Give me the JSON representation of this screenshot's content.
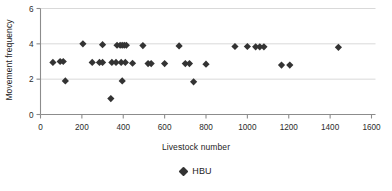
{
  "chart_data": {
    "type": "scatter",
    "title": "",
    "xlabel": "Livestock number",
    "ylabel": "Movement frequency",
    "xlim": [
      0,
      1600
    ],
    "ylim": [
      0,
      6
    ],
    "xticks": [
      0,
      200,
      400,
      600,
      800,
      1000,
      1200,
      1400,
      1600
    ],
    "yticks": [
      0,
      2,
      4,
      6
    ],
    "xtick_labels": [
      "0",
      "200",
      "400",
      "600",
      "800",
      "1000",
      "1200",
      "1400",
      "1600"
    ],
    "ytick_labels": [
      "0",
      "2",
      "4",
      "6"
    ],
    "grid": "horizontal",
    "grid_color": "#d9d9d9",
    "axis_color": "#8c8c8c",
    "marker": "diamond",
    "marker_color": "#333333",
    "marker_size": 6,
    "legend_position": "bottom",
    "series": [
      {
        "name": "HBU",
        "points": [
          [
            60,
            2.95
          ],
          [
            95,
            3.0
          ],
          [
            110,
            3.0
          ],
          [
            120,
            1.9
          ],
          [
            205,
            4.0
          ],
          [
            250,
            2.95
          ],
          [
            285,
            2.95
          ],
          [
            300,
            2.95
          ],
          [
            300,
            3.95
          ],
          [
            340,
            0.9
          ],
          [
            345,
            2.95
          ],
          [
            365,
            2.95
          ],
          [
            370,
            3.92
          ],
          [
            385,
            3.92
          ],
          [
            390,
            2.95
          ],
          [
            395,
            1.9
          ],
          [
            395,
            3.92
          ],
          [
            405,
            3.92
          ],
          [
            410,
            2.95
          ],
          [
            415,
            3.92
          ],
          [
            445,
            2.9
          ],
          [
            495,
            3.9
          ],
          [
            520,
            2.88
          ],
          [
            535,
            2.88
          ],
          [
            600,
            2.88
          ],
          [
            670,
            3.88
          ],
          [
            700,
            2.88
          ],
          [
            720,
            2.88
          ],
          [
            740,
            1.85
          ],
          [
            800,
            2.85
          ],
          [
            940,
            3.85
          ],
          [
            1000,
            3.85
          ],
          [
            1040,
            3.83
          ],
          [
            1060,
            3.83
          ],
          [
            1080,
            3.83
          ],
          [
            1165,
            2.8
          ],
          [
            1205,
            2.8
          ],
          [
            1440,
            3.8
          ]
        ]
      }
    ]
  },
  "legend": {
    "entries": [
      {
        "label": "HBU",
        "marker": "diamond",
        "color": "#333333"
      }
    ]
  },
  "axes": {
    "x_label": "Livestock number",
    "y_label": "Movement frequency"
  }
}
